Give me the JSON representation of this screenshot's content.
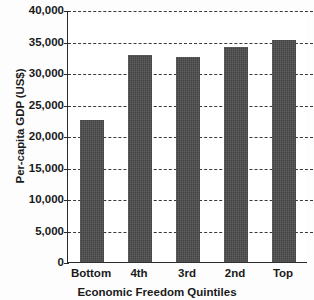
{
  "chart_data": {
    "type": "bar",
    "title": "",
    "xlabel": "Economic Freedom Quintiles",
    "ylabel": "Per-capita GDP (US$)",
    "categories": [
      "Bottom",
      "4th",
      "3rd",
      "2nd",
      "Top"
    ],
    "values": [
      22500,
      32800,
      32600,
      34100,
      35200
    ],
    "ylim": [
      0,
      40000
    ],
    "ytick_values": [
      0,
      5000,
      10000,
      15000,
      20000,
      25000,
      30000,
      35000,
      40000
    ],
    "ytick_labels": [
      "0",
      "5,000",
      "10,000",
      "15,000",
      "20,000",
      "25,000",
      "30,000",
      "35,000",
      "40,000"
    ],
    "grid": true,
    "grid_style": "dashed-horizontal",
    "legend": false,
    "bar_color": "#4b4b4b",
    "axis_color": "#2b2b2b",
    "gridline_color": "#3a3a3a",
    "plot_background": "#ffffff",
    "page_background": "#fdfdfd"
  }
}
